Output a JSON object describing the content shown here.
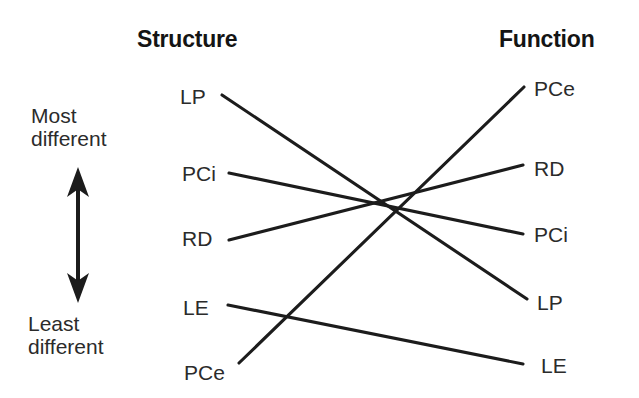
{
  "figure": {
    "type": "slopegraph",
    "background_color": "#ffffff",
    "line_color": "#1c1c1c",
    "text_color": "#2b2b2b"
  },
  "columns": {
    "left": {
      "title": "Structure"
    },
    "right": {
      "title": "Function"
    }
  },
  "axis": {
    "top_label_line1": "Most",
    "top_label_line2": "different",
    "bottom_label_line1": "Least",
    "bottom_label_line2": "different",
    "arrow": "double-headed-vertical-arrow"
  },
  "chart_data": {
    "type": "slopegraph",
    "title": "",
    "categories": [
      "LP",
      "PCi",
      "RD",
      "LE",
      "PCe"
    ],
    "axis_direction": "top = Most different, bottom = Least different",
    "columns": [
      "Structure",
      "Function"
    ],
    "left_order": [
      "LP",
      "PCi",
      "RD",
      "LE",
      "PCe"
    ],
    "right_order": [
      "PCe",
      "RD",
      "PCi",
      "LP",
      "LE"
    ],
    "left_ranks": {
      "LP": 1,
      "PCi": 2,
      "RD": 3,
      "LE": 4,
      "PCe": 5
    },
    "right_ranks": {
      "PCe": 1,
      "RD": 2,
      "PCi": 3,
      "LP": 4,
      "LE": 5
    },
    "series": [
      {
        "name": "LP",
        "left_rank": 1,
        "right_rank": 4
      },
      {
        "name": "PCi",
        "left_rank": 2,
        "right_rank": 3
      },
      {
        "name": "RD",
        "left_rank": 3,
        "right_rank": 2
      },
      {
        "name": "LE",
        "left_rank": 4,
        "right_rank": 5
      },
      {
        "name": "PCe",
        "left_rank": 5,
        "right_rank": 1
      }
    ],
    "xlabel": "",
    "ylabel": "Difference",
    "grid": false,
    "legend": "none"
  },
  "left_nodes": [
    {
      "label": "LP",
      "x": 180,
      "y": 86,
      "line_x": 222,
      "line_y": 95
    },
    {
      "label": "PCi",
      "x": 182,
      "y": 163,
      "line_x": 229,
      "line_y": 173
    },
    {
      "label": "RD",
      "x": 182,
      "y": 228,
      "line_x": 229,
      "line_y": 240
    },
    {
      "label": "LE",
      "x": 183,
      "y": 297,
      "line_x": 228,
      "line_y": 305
    },
    {
      "label": "PCe",
      "x": 184,
      "y": 362,
      "line_x": 239,
      "line_y": 363
    }
  ],
  "right_nodes": [
    {
      "label": "PCe",
      "x": 534,
      "y": 78,
      "line_x": 524,
      "line_y": 87
    },
    {
      "label": "RD",
      "x": 534,
      "y": 158,
      "line_x": 523,
      "line_y": 165
    },
    {
      "label": "PCi",
      "x": 534,
      "y": 224,
      "line_x": 523,
      "line_y": 234
    },
    {
      "label": "LP",
      "x": 537,
      "y": 292,
      "line_x": 527,
      "line_y": 299
    },
    {
      "label": "LE",
      "x": 541,
      "y": 355,
      "line_x": 523,
      "line_y": 364
    }
  ],
  "links": [
    {
      "name": "LP",
      "x1": 222,
      "y1": 95,
      "x2": 527,
      "y2": 299
    },
    {
      "name": "PCi",
      "x1": 229,
      "y1": 173,
      "x2": 523,
      "y2": 234
    },
    {
      "name": "RD",
      "x1": 229,
      "y1": 240,
      "x2": 523,
      "y2": 165
    },
    {
      "name": "LE",
      "x1": 228,
      "y1": 305,
      "x2": 523,
      "y2": 364
    },
    {
      "name": "PCe",
      "x1": 239,
      "y1": 363,
      "x2": 524,
      "y2": 87
    }
  ],
  "arrow_geometry": {
    "cx": 78,
    "top_tip_y": 167,
    "bottom_tip_y": 303,
    "head_width": 22,
    "head_height": 30,
    "shaft_width": 4
  }
}
